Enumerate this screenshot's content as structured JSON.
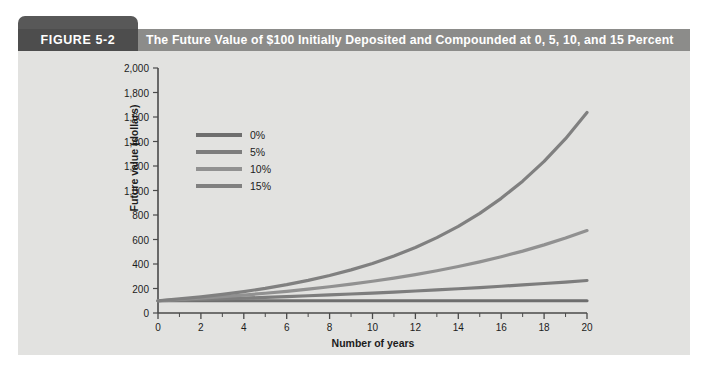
{
  "figure": {
    "chip_label": "FIGURE 5-2",
    "title": "The Future Value of $100 Initially Deposited and Compounded at 0, 5, 10, and 15 Percent"
  },
  "chart_data": {
    "type": "line",
    "title": "The Future Value of $100 Initially Deposited and Compounded at 0, 5, 10, and 15 Percent",
    "xlabel": "Number of years",
    "ylabel": "Future value (dollars)",
    "xlim": [
      0,
      20
    ],
    "ylim": [
      0,
      2000
    ],
    "grid": false,
    "legend_position": "upper-left-inside",
    "x_tick_labels": [
      "0",
      "2",
      "4",
      "6",
      "8",
      "10",
      "12",
      "14",
      "16",
      "18",
      "20"
    ],
    "x_tick_values": [
      0,
      2,
      4,
      6,
      8,
      10,
      12,
      14,
      16,
      18,
      20
    ],
    "x_minor_tick_interval": 1,
    "y_tick_labels": [
      "0",
      "200",
      "400",
      "600",
      "800",
      "1,000",
      "1,200",
      "1,400",
      "1,600",
      "1,800",
      "2,000"
    ],
    "y_tick_values": [
      0,
      200,
      400,
      600,
      800,
      1000,
      1200,
      1400,
      1600,
      1800,
      2000
    ],
    "x": [
      0,
      1,
      2,
      3,
      4,
      5,
      6,
      7,
      8,
      9,
      10,
      11,
      12,
      13,
      14,
      15,
      16,
      17,
      18,
      19,
      20
    ],
    "series": [
      {
        "name": "0%",
        "color": "#6e6e6e",
        "values": [
          100,
          100,
          100,
          100,
          100,
          100,
          100,
          100,
          100,
          100,
          100,
          100,
          100,
          100,
          100,
          100,
          100,
          100,
          100,
          100,
          100
        ]
      },
      {
        "name": "5%",
        "color": "#7d7d7d",
        "values": [
          100,
          105,
          110.3,
          115.8,
          121.6,
          127.6,
          134,
          140.7,
          147.7,
          155.1,
          162.9,
          171,
          179.6,
          188.6,
          198,
          207.9,
          218.3,
          229.2,
          240.7,
          252.7,
          265.3
        ]
      },
      {
        "name": "10%",
        "color": "#919191",
        "values": [
          100,
          110,
          121,
          133.1,
          146.4,
          161.1,
          177.2,
          194.9,
          214.4,
          235.8,
          259.4,
          285.3,
          313.8,
          345.2,
          379.8,
          417.7,
          459.5,
          505.4,
          556,
          611.6,
          672.7
        ]
      },
      {
        "name": "15%",
        "color": "#808080",
        "values": [
          100,
          115,
          132.3,
          152.1,
          174.9,
          201.1,
          231.3,
          266,
          305.9,
          351.8,
          404.6,
          465.2,
          535,
          615.3,
          707.6,
          813.7,
          935.8,
          1076.3,
          1237.7,
          1423.2,
          1636.7
        ]
      }
    ]
  },
  "colors": {
    "panel_background": "#e2e2e0",
    "title_bar": "#8c8c8a",
    "chip": "#4d4d4d",
    "axis": "#4a4a4a",
    "text": "#1c1c1c"
  }
}
